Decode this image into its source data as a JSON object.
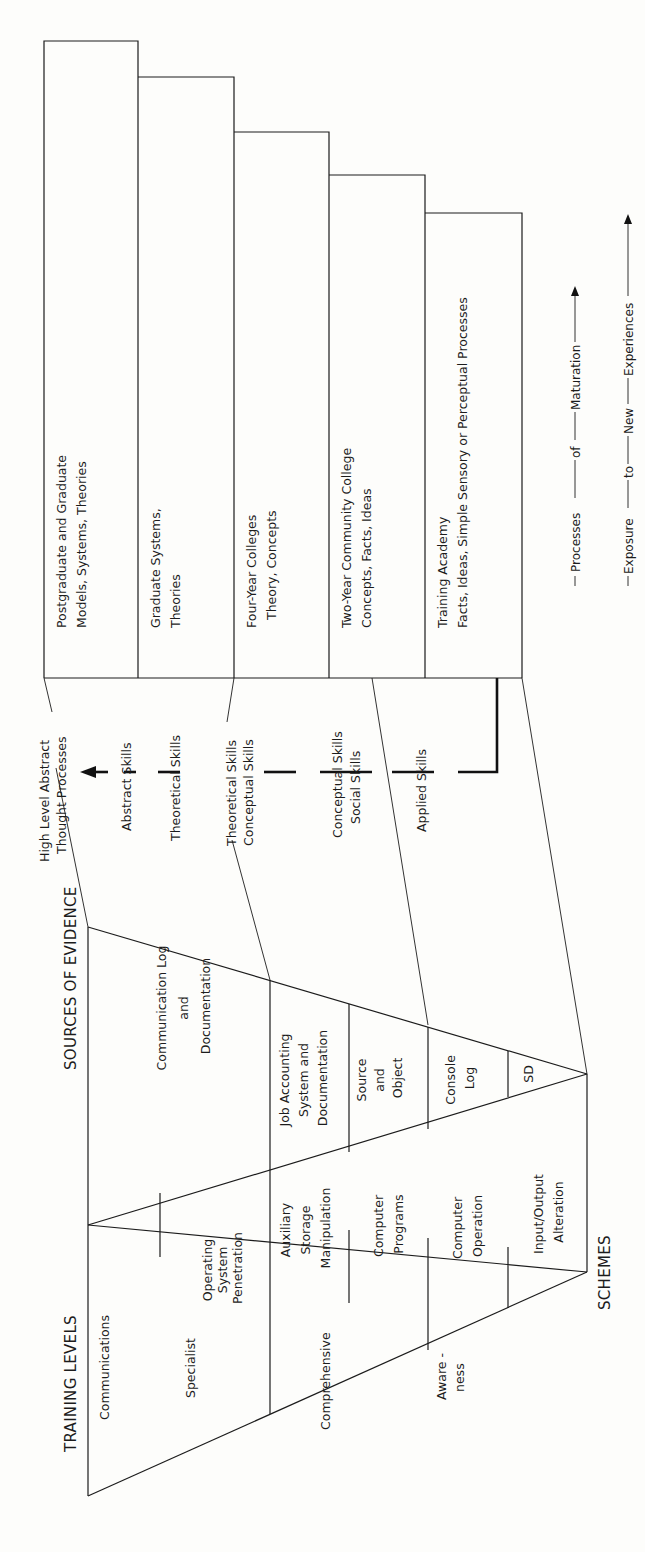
{
  "headers": {
    "training_levels": "TRAINING LEVELS",
    "sources_of_evidence": "SOURCES OF EVIDENCE",
    "schemes": "SCHEMES"
  },
  "training_levels": [
    {
      "label": "Communications"
    },
    {
      "label": "Specialist"
    },
    {
      "label": "Comprehensive"
    },
    {
      "label_lines": [
        "Aware -",
        "ness"
      ]
    }
  ],
  "schemes": [
    {
      "label_lines": [
        "Operating",
        "System",
        "Penetration"
      ]
    },
    {
      "label_lines": [
        "Auxiliary",
        "Storage",
        "Manipulation"
      ]
    },
    {
      "label_lines": [
        "Computer",
        "Programs"
      ]
    },
    {
      "label_lines": [
        "Computer",
        "Operation"
      ]
    },
    {
      "label_lines": [
        "Input/Output",
        "Alteration"
      ]
    }
  ],
  "sources_of_evidence": [
    {
      "label_lines": [
        "Communication Log",
        "and",
        "Documentation"
      ]
    },
    {
      "label_lines": [
        "Job Accounting",
        "System and",
        "Documentation"
      ]
    },
    {
      "label_lines": [
        "Source",
        "and",
        "Object"
      ]
    },
    {
      "label_lines": [
        "Console",
        "Log"
      ]
    },
    {
      "label_lines": [
        "SD"
      ]
    }
  ],
  "skills": [
    {
      "label_lines": [
        "High Level Abstract",
        "Thought Processes"
      ]
    },
    {
      "label_lines": [
        "Abstract Skills"
      ]
    },
    {
      "label_lines": [
        "Theoretical Skills"
      ]
    },
    {
      "label_lines": [
        "Theoretical Skills",
        "Conceptual Skills"
      ]
    },
    {
      "label_lines": [
        "Conceptual Skills",
        "Social Skills"
      ]
    },
    {
      "label_lines": [
        "Applied Skills"
      ]
    }
  ],
  "education_steps": [
    {
      "label_lines": [
        "Postgraduate and Graduate",
        "Models, Systems, Theories"
      ]
    },
    {
      "label_lines": [
        "Graduate Systems,",
        "Theories"
      ]
    },
    {
      "label_lines": [
        "Four-Year Colleges",
        "Theory, Concepts"
      ]
    },
    {
      "label_lines": [
        "Two-Year Community College",
        "Concepts, Facts, Ideas"
      ]
    },
    {
      "label_lines": [
        "Training Academy",
        "Facts, Ideas, Simple Sensory or Perceptual Processes"
      ]
    }
  ],
  "axes": {
    "maturation": [
      "Processes",
      "of",
      "Maturation"
    ],
    "exposure": [
      "Exposure",
      "to",
      "New",
      "Experiences"
    ]
  }
}
